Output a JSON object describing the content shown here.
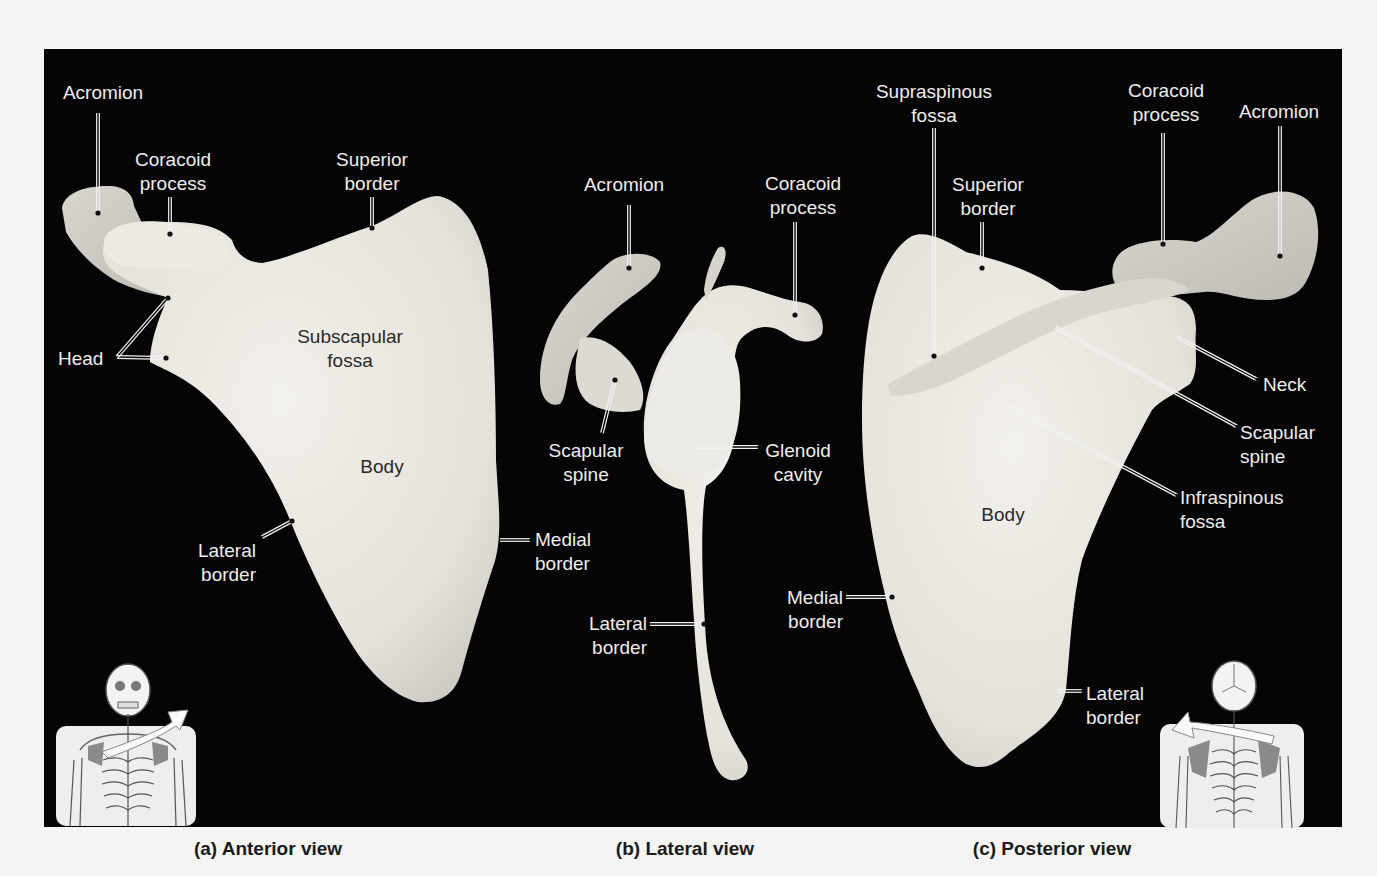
{
  "figure": {
    "panel_color": "#050505",
    "bone_color": "#e6e4dd",
    "label_color": "#ededed",
    "captions": [
      {
        "id": "a",
        "text": "(a) Anterior view",
        "x": 268
      },
      {
        "id": "b",
        "text": "(b) Lateral view",
        "x": 685
      },
      {
        "id": "c",
        "text": "(c) Posterior view",
        "x": 1052
      }
    ]
  },
  "views": {
    "anterior": {
      "labels": [
        {
          "text": "Acromion",
          "x": 103,
          "y": 81,
          "align": "center"
        },
        {
          "text": "Coracoid\nprocess",
          "x": 173,
          "y": 148,
          "align": "center"
        },
        {
          "text": "Superior\nborder",
          "x": 372,
          "y": 148,
          "align": "center"
        },
        {
          "text": "Head",
          "x": 58,
          "y": 347,
          "align": "left"
        },
        {
          "text": "Subscapular\nfossa",
          "x": 350,
          "y": 325,
          "align": "center",
          "dark": true
        },
        {
          "text": "Body",
          "x": 382,
          "y": 455,
          "align": "center",
          "dark": true
        },
        {
          "text": "Lateral\nborder",
          "x": 256,
          "y": 539,
          "align": "right"
        },
        {
          "text": "Medial\nborder",
          "x": 535,
          "y": 528,
          "align": "left"
        }
      ]
    },
    "lateral": {
      "labels": [
        {
          "text": "Acromion",
          "x": 624,
          "y": 173,
          "align": "center"
        },
        {
          "text": "Coracoid\nprocess",
          "x": 803,
          "y": 172,
          "align": "center"
        },
        {
          "text": "Scapular\nspine",
          "x": 586,
          "y": 439,
          "align": "center"
        },
        {
          "text": "Glenoid\ncavity",
          "x": 798,
          "y": 439,
          "align": "center"
        },
        {
          "text": "Lateral\nborder",
          "x": 647,
          "y": 612,
          "align": "right"
        }
      ]
    },
    "posterior": {
      "labels": [
        {
          "text": "Supraspinous\nfossa",
          "x": 934,
          "y": 80,
          "align": "center"
        },
        {
          "text": "Coracoid\nprocess",
          "x": 1166,
          "y": 79,
          "align": "center"
        },
        {
          "text": "Acromion",
          "x": 1279,
          "y": 100,
          "align": "center"
        },
        {
          "text": "Superior\nborder",
          "x": 988,
          "y": 173,
          "align": "center"
        },
        {
          "text": "Neck",
          "x": 1263,
          "y": 373,
          "align": "left"
        },
        {
          "text": "Scapular\nspine",
          "x": 1240,
          "y": 421,
          "align": "left"
        },
        {
          "text": "Infraspinous\nfossa",
          "x": 1180,
          "y": 486,
          "align": "left"
        },
        {
          "text": "Body",
          "x": 1003,
          "y": 503,
          "align": "center",
          "dark": true
        },
        {
          "text": "Medial\nborder",
          "x": 843,
          "y": 586,
          "align": "right"
        },
        {
          "text": "Lateral\nborder",
          "x": 1086,
          "y": 682,
          "align": "left"
        }
      ]
    }
  },
  "leaders": [
    {
      "label": "Acromion (a)",
      "pts": [
        [
          98,
          113
        ],
        [
          98,
          213
        ]
      ]
    },
    {
      "label": "Coracoid process (a)",
      "pts": [
        [
          170,
          197
        ],
        [
          170,
          234
        ]
      ]
    },
    {
      "label": "Superior border (a)",
      "pts": [
        [
          372,
          197
        ],
        [
          372,
          228
        ]
      ]
    },
    {
      "label": "Head (a) upper",
      "pts": [
        [
          117,
          357
        ],
        [
          168,
          298
        ]
      ]
    },
    {
      "label": "Head (a) lower",
      "pts": [
        [
          117,
          357
        ],
        [
          166,
          358
        ]
      ]
    },
    {
      "label": "Lateral border (a)",
      "pts": [
        [
          262,
          537
        ],
        [
          292,
          521
        ]
      ]
    },
    {
      "label": "Medial border (a)",
      "pts": [
        [
          500,
          540
        ],
        [
          532,
          540
        ]
      ]
    },
    {
      "label": "Acromion (b)",
      "pts": [
        [
          629,
          205
        ],
        [
          629,
          268
        ]
      ]
    },
    {
      "label": "Coracoid process (b)",
      "pts": [
        [
          795,
          222
        ],
        [
          795,
          315
        ]
      ]
    },
    {
      "label": "Scapular spine (b)",
      "pts": [
        [
          602,
          433
        ],
        [
          615,
          380
        ]
      ]
    },
    {
      "label": "Glenoid cavity (b)",
      "pts": [
        [
          696,
          447
        ],
        [
          760,
          447
        ]
      ]
    },
    {
      "label": "Lateral border (b)",
      "pts": [
        [
          650,
          624
        ],
        [
          704,
          624
        ]
      ]
    },
    {
      "label": "Supraspinous fossa (c)",
      "pts": [
        [
          934,
          128
        ],
        [
          934,
          356
        ]
      ]
    },
    {
      "label": "Coracoid process (c)",
      "pts": [
        [
          1163,
          133
        ],
        [
          1163,
          244
        ]
      ]
    },
    {
      "label": "Acromion (c)",
      "pts": [
        [
          1280,
          126
        ],
        [
          1280,
          256
        ]
      ]
    },
    {
      "label": "Superior border (c)",
      "pts": [
        [
          982,
          222
        ],
        [
          982,
          268
        ]
      ]
    },
    {
      "label": "Neck (c)",
      "pts": [
        [
          1177,
          337
        ],
        [
          1258,
          380
        ]
      ]
    },
    {
      "label": "Scapular spine (c)",
      "pts": [
        [
          1055,
          327
        ],
        [
          1238,
          427
        ]
      ]
    },
    {
      "label": "Infraspinous fossa (c)",
      "pts": [
        [
          1008,
          405
        ],
        [
          1178,
          496
        ]
      ]
    },
    {
      "label": "Medial border (c)",
      "pts": [
        [
          846,
          597
        ],
        [
          892,
          597
        ]
      ]
    },
    {
      "label": "Lateral border (c)",
      "pts": [
        [
          1058,
          691
        ],
        [
          1084,
          691
        ]
      ]
    }
  ],
  "insets": [
    {
      "name": "anterior-skeleton-inset",
      "view": "anterior"
    },
    {
      "name": "posterior-skeleton-inset",
      "view": "posterior"
    }
  ]
}
